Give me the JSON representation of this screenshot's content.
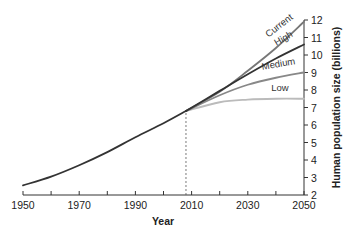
{
  "chart_data": {
    "type": "line",
    "title": "",
    "xlabel": "Year",
    "ylabel": "Human population size (billions)",
    "xlim": [
      1950,
      2050
    ],
    "ylim": [
      2,
      12
    ],
    "x_ticks": [
      1950,
      1960,
      1970,
      1980,
      1990,
      2000,
      2010,
      2020,
      2030,
      2040,
      2050
    ],
    "x_tick_labels": [
      "1950",
      "1970",
      "1990",
      "2010",
      "2030",
      "2050"
    ],
    "y_ticks": [
      2,
      3,
      4,
      5,
      6,
      7,
      8,
      9,
      10,
      11,
      12
    ],
    "y_axis_position": "right",
    "grid": false,
    "legend": "inline labels at line ends",
    "annotations": [
      {
        "type": "vertical-dashed-line",
        "x": 2008,
        "from_y": 2,
        "to_y": 6.8
      }
    ],
    "series": [
      {
        "name": "Historical",
        "color": "#333333",
        "x": [
          1950,
          1960,
          1970,
          1980,
          1990,
          2000,
          2008
        ],
        "values": [
          2.55,
          3.05,
          3.7,
          4.45,
          5.3,
          6.1,
          6.8
        ]
      },
      {
        "name": "Current",
        "color": "#777777",
        "x": [
          2008,
          2020,
          2030,
          2040,
          2050
        ],
        "values": [
          6.8,
          7.9,
          9.1,
          10.4,
          11.9
        ]
      },
      {
        "name": "High",
        "color": "#333333",
        "x": [
          2008,
          2020,
          2030,
          2040,
          2050
        ],
        "values": [
          6.8,
          7.95,
          8.9,
          9.8,
          10.6
        ]
      },
      {
        "name": "Medium",
        "color": "#888888",
        "x": [
          2008,
          2020,
          2030,
          2040,
          2050
        ],
        "values": [
          6.8,
          7.7,
          8.3,
          8.7,
          9.0
        ]
      },
      {
        "name": "Low",
        "color": "#bbbbbb",
        "x": [
          2008,
          2020,
          2030,
          2040,
          2050
        ],
        "values": [
          6.8,
          7.3,
          7.45,
          7.5,
          7.5
        ]
      }
    ]
  }
}
